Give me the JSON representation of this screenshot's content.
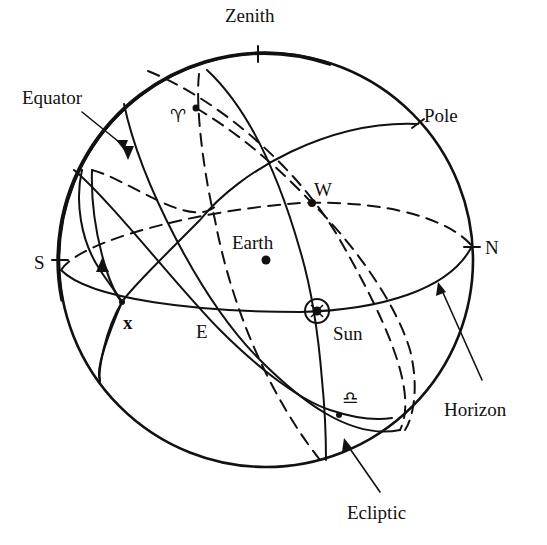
{
  "diagram": {
    "labels": {
      "zenith": "Zenith",
      "pole": "Pole",
      "equator": "Equator",
      "earth": "Earth",
      "west": "W",
      "north": "N",
      "south": "S",
      "east": "E",
      "x_point": "x",
      "sun": "Sun",
      "horizon": "Horizon",
      "ecliptic": "Ecliptic",
      "aries": "♈",
      "libra": "♎"
    },
    "colors": {
      "ink": "#111111",
      "background": "#ffffff"
    }
  }
}
